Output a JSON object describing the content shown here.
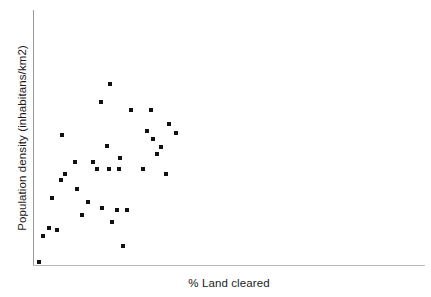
{
  "chart_data": {
    "type": "scatter",
    "title": "",
    "xlabel": "% Land cleared",
    "ylabel": "Population density (inhabitans/km2)",
    "grid": false,
    "legend": null,
    "xlim": [
      0,
      100
    ],
    "ylim": [
      0,
      100
    ],
    "xticks": [],
    "yticks": [],
    "series": [
      {
        "name": "",
        "marker": "square",
        "marker_color": "#111111",
        "marker_size_px": 4,
        "points": [
          {
            "x": 3.0,
            "y": 1.6
          },
          {
            "x": 5.0,
            "y": 13.7
          },
          {
            "x": 8.0,
            "y": 17.2
          },
          {
            "x": 12.0,
            "y": 16.4
          },
          {
            "x": 9.5,
            "y": 31.3
          },
          {
            "x": 14.5,
            "y": 60.9
          },
          {
            "x": 14.0,
            "y": 39.8
          },
          {
            "x": 16.0,
            "y": 42.6
          },
          {
            "x": 21.0,
            "y": 48.4
          },
          {
            "x": 22.0,
            "y": 35.5
          },
          {
            "x": 24.5,
            "y": 23.4
          },
          {
            "x": 29.5,
            "y": 48.4
          },
          {
            "x": 27.0,
            "y": 29.7
          },
          {
            "x": 31.5,
            "y": 44.9
          },
          {
            "x": 33.5,
            "y": 76.6
          },
          {
            "x": 34.0,
            "y": 26.6
          },
          {
            "x": 36.5,
            "y": 55.9
          },
          {
            "x": 37.5,
            "y": 45.3
          },
          {
            "x": 38.0,
            "y": 84.8
          },
          {
            "x": 39.0,
            "y": 20.3
          },
          {
            "x": 41.5,
            "y": 25.8
          },
          {
            "x": 42.5,
            "y": 44.9
          },
          {
            "x": 43.0,
            "y": 50.4
          },
          {
            "x": 44.5,
            "y": 9.0
          },
          {
            "x": 46.5,
            "y": 25.8
          },
          {
            "x": 48.5,
            "y": 72.7
          },
          {
            "x": 54.5,
            "y": 44.9
          },
          {
            "x": 56.5,
            "y": 62.9
          },
          {
            "x": 58.5,
            "y": 73.0
          },
          {
            "x": 59.5,
            "y": 59.0
          },
          {
            "x": 61.5,
            "y": 52.3
          },
          {
            "x": 63.5,
            "y": 55.5
          },
          {
            "x": 66.0,
            "y": 42.6
          },
          {
            "x": 67.5,
            "y": 66.4
          },
          {
            "x": 71.0,
            "y": 62.1
          }
        ]
      }
    ]
  },
  "axes": {
    "y_axis_color": "#9a9a9a",
    "x_axis_color": "#b9b9b9"
  }
}
